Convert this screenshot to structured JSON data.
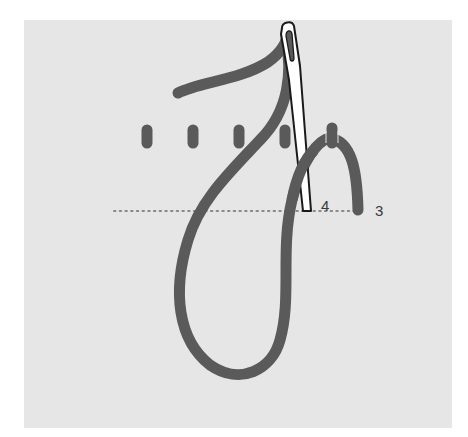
{
  "diagram": {
    "labels": {
      "point_4": "4",
      "point_3": "3"
    },
    "colors": {
      "page_background": "#ffffff",
      "fabric": "#e6e6e6",
      "thread": "#5a5a5a",
      "needle_fill": "#ffffff",
      "needle_outline": "#1a1a1a",
      "guide_dots": "#8a8a8a",
      "label_text": "#3a3a3a"
    },
    "elements": {
      "fabric_panel": "fabric",
      "stitches": 5,
      "guide_line": "dotted horizontal line",
      "needle": "needle with threaded eye",
      "thread": "looped working thread"
    }
  }
}
